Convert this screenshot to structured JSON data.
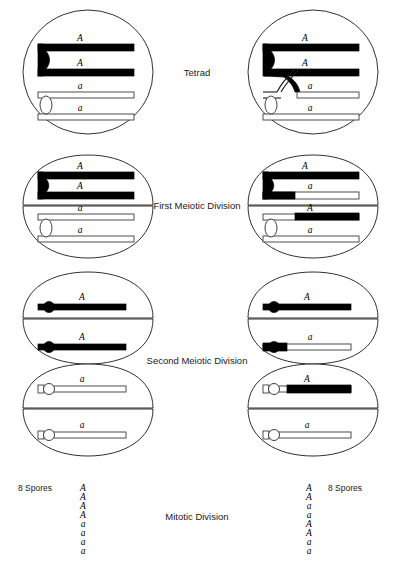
{
  "figure": {
    "background_color": "#ffffff",
    "ink_color": "#000000",
    "allele_dominant": "A",
    "allele_recessive": "a"
  },
  "stage_labels": {
    "tetrad": "Tetrad",
    "first_meiotic_division": "First Meiotic Division",
    "second_meiotic_division": "Second Meiotic Division",
    "mitotic_division": "Mitotic Division"
  },
  "columns": {
    "left": {
      "name": "no-crossing-over",
      "spores_label": "8 Spores",
      "spores": [
        "A",
        "A",
        "A",
        "A",
        "a",
        "a",
        "a",
        "a"
      ],
      "tetrad": {
        "chromatids": [
          {
            "allele": "A",
            "color": "black"
          },
          {
            "allele": "A",
            "color": "black"
          },
          {
            "allele": "a",
            "color": "white"
          },
          {
            "allele": "a",
            "color": "white"
          }
        ],
        "crossover": false
      },
      "first_meiotic_division": {
        "cells": [
          {
            "chromatids": [
              {
                "allele": "A",
                "color": "black"
              },
              {
                "allele": "A",
                "color": "black"
              }
            ]
          },
          {
            "chromatids": [
              {
                "allele": "a",
                "color": "white"
              },
              {
                "allele": "a",
                "color": "white"
              }
            ]
          }
        ]
      },
      "second_meiotic_division": {
        "cells": [
          {
            "allele": "A",
            "color": "black"
          },
          {
            "allele": "A",
            "color": "black"
          },
          {
            "allele": "a",
            "color": "white"
          },
          {
            "allele": "a",
            "color": "white"
          }
        ]
      }
    },
    "right": {
      "name": "with-crossing-over",
      "spores_label": "8 Spores",
      "spores": [
        "A",
        "A",
        "a",
        "a",
        "A",
        "A",
        "a",
        "a"
      ],
      "tetrad": {
        "chromatids": [
          {
            "allele": "A",
            "color": "black"
          },
          {
            "allele": "A",
            "color": "black"
          },
          {
            "allele": "a",
            "color": "white"
          },
          {
            "allele": "a",
            "color": "white"
          }
        ],
        "crossover": true
      },
      "first_meiotic_division": {
        "cells": [
          {
            "chromatids": [
              {
                "allele": "A",
                "color": "black"
              },
              {
                "allele": "a",
                "color": "recombinant-black-left"
              }
            ]
          },
          {
            "chromatids": [
              {
                "allele": "A",
                "color": "recombinant-white-left"
              },
              {
                "allele": "a",
                "color": "white"
              }
            ]
          }
        ]
      },
      "second_meiotic_division": {
        "cells": [
          {
            "allele": "A",
            "color": "black"
          },
          {
            "allele": "a",
            "color": "recombinant-black-left"
          },
          {
            "allele": "A",
            "color": "recombinant-white-left"
          },
          {
            "allele": "a",
            "color": "white"
          }
        ]
      }
    }
  }
}
